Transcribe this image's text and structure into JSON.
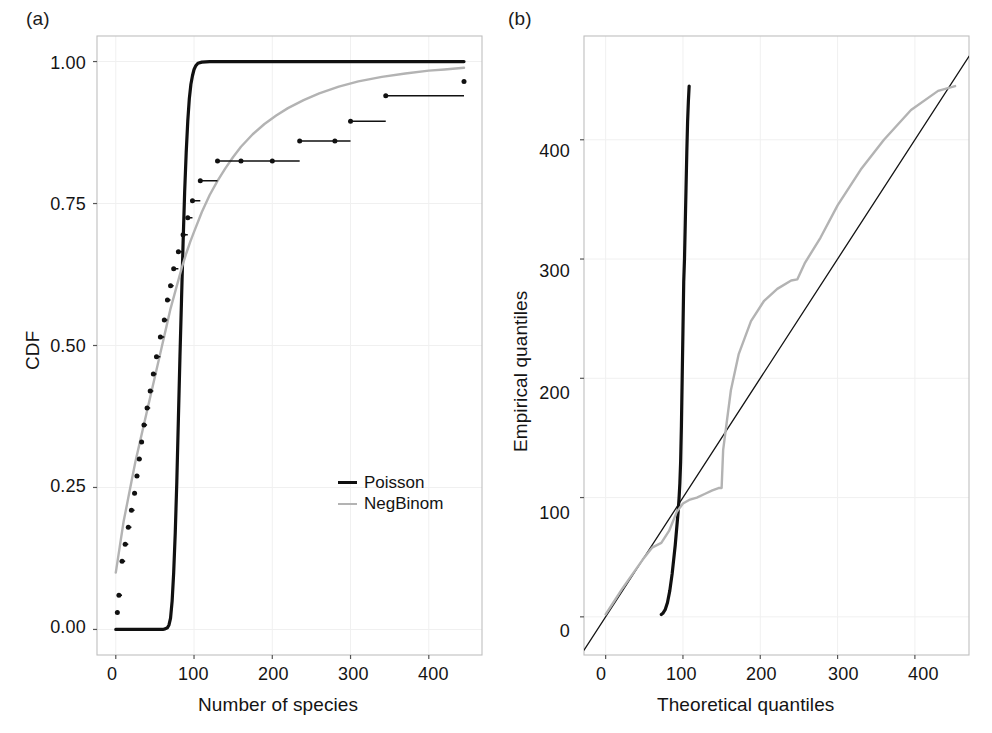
{
  "figure": {
    "background": "#ffffff",
    "grid_color": "#f0f0f0",
    "frame_color": "#bfbfbf",
    "tick_color": "#555555",
    "poisson_color": "#101010",
    "negbinom_color": "#b3b3b3",
    "empirical_color": "#111111"
  },
  "panels": [
    {
      "id": "a",
      "label": "(a)",
      "xlabel": "Number of species",
      "ylabel": "CDF",
      "xticks": [
        0,
        100,
        200,
        300,
        400
      ],
      "xtick_labels": [
        "0",
        "100",
        "200",
        "300",
        "400"
      ],
      "yticks": [
        0.0,
        0.25,
        0.5,
        0.75,
        1.0
      ],
      "ytick_labels": [
        "0.00",
        "0.25",
        "0.50",
        "0.75",
        "1.00"
      ],
      "xlim": [
        -24,
        468
      ],
      "ylim": [
        -0.045,
        1.045
      ],
      "grid": true,
      "legend": {
        "position": "center-right",
        "entries": [
          {
            "label": "Poisson",
            "color": "#101010",
            "width": 3.4
          },
          {
            "label": "NegBinom",
            "color": "#b3b3b3",
            "width": 2.4
          }
        ]
      }
    },
    {
      "id": "b",
      "label": "(b)",
      "xlabel": "Theoretical quantiles",
      "ylabel": "Empirical quantiles",
      "xticks": [
        0,
        100,
        200,
        300,
        400
      ],
      "xtick_labels": [
        "0",
        "100",
        "200",
        "300",
        "400"
      ],
      "yticks": [
        0,
        100,
        200,
        300,
        400
      ],
      "ytick_labels": [
        "0",
        "100",
        "200",
        "300",
        "400"
      ],
      "xlim": [
        -28,
        470
      ],
      "ylim": [
        -32,
        487
      ],
      "grid": true
    }
  ],
  "chart_data": [
    {
      "type": "line",
      "panel": "a",
      "title": "",
      "xlabel": "Number of species",
      "ylabel": "CDF",
      "xlim": [
        -24,
        468
      ],
      "ylim": [
        -0.045,
        1.045
      ],
      "grid": true,
      "legend_position": "center-right",
      "series": [
        {
          "name": "Poisson",
          "color": "#101010",
          "style": "solid",
          "description": "Fitted Poisson CDF: near-zero until ~65 species, extremely steep rise between 70 and 105, saturating at 1.00 thereafter.",
          "x": [
            0,
            20,
            40,
            50,
            55,
            60,
            63,
            66,
            68,
            70,
            72,
            74,
            76,
            78,
            80,
            82,
            84,
            86,
            88,
            90,
            92,
            94,
            96,
            98,
            100,
            102,
            105,
            110,
            120,
            150,
            200,
            250,
            300,
            350,
            400,
            445
          ],
          "y": [
            0.0,
            0.0,
            0.0,
            0.0,
            0.0,
            0.0,
            0.001,
            0.003,
            0.008,
            0.02,
            0.05,
            0.1,
            0.17,
            0.26,
            0.37,
            0.48,
            0.58,
            0.68,
            0.77,
            0.84,
            0.895,
            0.935,
            0.96,
            0.975,
            0.986,
            0.992,
            0.997,
            0.999,
            1.0,
            1.0,
            1.0,
            1.0,
            1.0,
            1.0,
            1.0,
            1.0
          ]
        },
        {
          "name": "NegBinom",
          "color": "#b3b3b3",
          "style": "solid",
          "description": "Fitted Negative Binomial CDF: smooth concave rise from ~0.10 at x=0 to ~0.99 at x=445.",
          "x": [
            0,
            5,
            10,
            15,
            20,
            25,
            30,
            35,
            40,
            45,
            50,
            55,
            60,
            65,
            70,
            75,
            80,
            85,
            90,
            95,
            100,
            110,
            120,
            130,
            140,
            150,
            160,
            175,
            190,
            205,
            220,
            240,
            260,
            285,
            310,
            340,
            370,
            400,
            420,
            445
          ],
          "y": [
            0.1,
            0.145,
            0.19,
            0.225,
            0.26,
            0.295,
            0.325,
            0.355,
            0.385,
            0.415,
            0.445,
            0.475,
            0.505,
            0.535,
            0.565,
            0.59,
            0.615,
            0.64,
            0.662,
            0.682,
            0.7,
            0.735,
            0.765,
            0.79,
            0.812,
            0.832,
            0.85,
            0.872,
            0.89,
            0.905,
            0.918,
            0.932,
            0.944,
            0.956,
            0.965,
            0.973,
            0.979,
            0.984,
            0.986,
            0.989
          ]
        },
        {
          "name": "Empirical",
          "color": "#111111",
          "style": "step-with-points",
          "description": "Empirical CDF drawn as a right-continuous step function: each observation is a filled dot at its (x, cdf) value followed by a horizontal segment running to the next observed x value.",
          "x": [
            2,
            4,
            8,
            12,
            16,
            20,
            24,
            27,
            30,
            33,
            36,
            40,
            44,
            48,
            52,
            57,
            62,
            66,
            70,
            74,
            80,
            86,
            92,
            98,
            108,
            130,
            160,
            200,
            235,
            280,
            300,
            345,
            445
          ],
          "y": [
            0.03,
            0.06,
            0.12,
            0.15,
            0.18,
            0.21,
            0.24,
            0.27,
            0.3,
            0.33,
            0.36,
            0.39,
            0.42,
            0.45,
            0.48,
            0.515,
            0.545,
            0.58,
            0.605,
            0.635,
            0.665,
            0.695,
            0.725,
            0.755,
            0.79,
            0.825,
            0.825,
            0.825,
            0.86,
            0.86,
            0.895,
            0.94,
            0.965
          ]
        }
      ]
    },
    {
      "type": "line",
      "panel": "b",
      "title": "",
      "xlabel": "Theoretical quantiles",
      "ylabel": "Empirical quantiles",
      "xlim": [
        -28,
        470
      ],
      "ylim": [
        -32,
        487
      ],
      "grid": true,
      "series": [
        {
          "name": "identity",
          "color": "#141414",
          "style": "solid-thin",
          "description": "1:1 reference line y = x spanning the plot frame.",
          "x": [
            -28,
            470
          ],
          "y": [
            -28,
            470
          ]
        },
        {
          "name": "Poisson",
          "color": "#101010",
          "style": "solid",
          "description": "Poisson Q-Q curve: nearly vertical, theoretical quantiles compressed between ~70 and ~108 while empirical quantiles span 0 to 445.",
          "x": [
            72,
            74,
            77,
            80,
            83,
            86,
            88,
            90,
            92,
            94,
            95,
            96,
            97,
            98,
            99,
            100,
            101,
            102,
            103,
            104,
            105,
            106,
            107,
            108
          ],
          "y": [
            2,
            3,
            6,
            12,
            22,
            36,
            48,
            60,
            75,
            90,
            100,
            112,
            130,
            160,
            200,
            240,
            281,
            300,
            330,
            360,
            390,
            415,
            432,
            445
          ]
        },
        {
          "name": "NegBinom",
          "color": "#b3b3b3",
          "style": "solid",
          "description": "Negative Binomial Q-Q curve: tracks the identity line at low quantiles, flattens near 100, jumps sharply at ~150, plateaus near 283, then rises above the identity line to ~445.",
          "x": [
            0,
            10,
            22,
            35,
            48,
            60,
            72,
            82,
            92,
            100,
            108,
            118,
            128,
            138,
            146,
            150,
            152,
            156,
            162,
            172,
            188,
            205,
            222,
            240,
            248,
            258,
            278,
            300,
            330,
            360,
            395,
            430,
            452
          ],
          "y": [
            2,
            12,
            24,
            36,
            48,
            58,
            62,
            72,
            88,
            95,
            98,
            100,
            103,
            106,
            108,
            108,
            140,
            160,
            190,
            220,
            248,
            265,
            275,
            282,
            283,
            297,
            318,
            345,
            375,
            400,
            425,
            441,
            445
          ]
        }
      ]
    }
  ]
}
